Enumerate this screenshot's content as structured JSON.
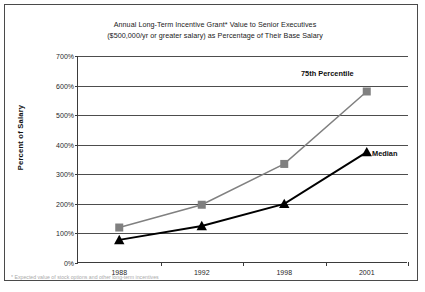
{
  "chart_data": {
    "type": "line",
    "title": "Annual Long-Term Incentive Grant* Value to Senior Executives ($500,000/yr or greater salary) as Percentage of Their Base Salary",
    "title_lines": [
      "Annual Long-Term Incentive Grant* Value to Senior Executives",
      "($500,000/yr or greater salary) as Percentage of Their Base Salary"
    ],
    "xlabel": "",
    "ylabel": "Percent of Salary",
    "categories": [
      "1988",
      "1992",
      "1998",
      "2001"
    ],
    "ylim": [
      0,
      700
    ],
    "ytick_labels": [
      "0%",
      "100%",
      "200%",
      "300%",
      "400%",
      "500%",
      "600%",
      "700%"
    ],
    "ytick_values": [
      0,
      100,
      200,
      300,
      400,
      500,
      600,
      700
    ],
    "grid": true,
    "legend_position": "inline-right",
    "series": [
      {
        "name": "75th Percentile",
        "label": "75th Percentile",
        "color": "#808080",
        "marker": "square",
        "values": [
          120,
          197,
          335,
          580
        ]
      },
      {
        "name": "Median",
        "label": "Median",
        "color": "#000000",
        "marker": "triangle",
        "values": [
          78,
          125,
          200,
          375
        ]
      }
    ]
  },
  "footnote": {
    "text": "* Expected value of stock options and other long-term incentives"
  }
}
